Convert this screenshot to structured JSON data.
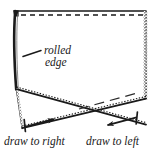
{
  "figure": {
    "kind": "sewing-instruction-diagram",
    "background_color": "#ffffff",
    "ink_color": "#1a1a1a"
  },
  "labels": {
    "rolled_edge": {
      "line1": "rolled",
      "line2": "edge"
    },
    "draw_left_caption": "draw to right",
    "draw_right_caption": "draw to left"
  },
  "geometry": {
    "panel_top_y": 11,
    "panel_left_x": 14,
    "panel_right_x": 146,
    "panel_bottom_left_y": 128,
    "panel_bottom_right_y": 125,
    "cross_point": {
      "x": 78,
      "y": 110
    }
  },
  "strokes": {
    "top_solid": {
      "from": [
        15,
        11
      ],
      "to": [
        146,
        11
      ]
    },
    "top_dashed": {
      "from": [
        20,
        15
      ],
      "to": [
        143,
        15
      ],
      "dash": "5,4"
    },
    "left_edge_rolled": {
      "from": [
        15,
        11
      ],
      "to": [
        16,
        89
      ]
    },
    "right_edge_stippled": {
      "from": [
        146,
        11
      ],
      "to": [
        146,
        99
      ]
    },
    "diagonal_down_right": {
      "from": [
        16,
        89
      ],
      "to": [
        146,
        125
      ]
    },
    "diagonal_down_left": {
      "from": [
        146,
        99
      ],
      "to": [
        22,
        128
      ]
    },
    "bottom_left_stub": {
      "from": [
        16,
        89
      ],
      "to": [
        22,
        128
      ]
    },
    "hint_dashed_diagonal": {
      "from": [
        78,
        110
      ],
      "to": [
        139,
        93
      ],
      "dash": "9,5"
    },
    "leader_rolled_edge": {
      "from": [
        38,
        50
      ],
      "to": [
        22,
        57
      ]
    }
  },
  "arrows": [
    {
      "name": "draw-to-right-arrow",
      "direction": "right",
      "tail": [
        24,
        126
      ],
      "head": [
        57,
        118
      ],
      "tick": {
        "from": [
          24,
          119
        ],
        "to": [
          25,
          131
        ]
      }
    },
    {
      "name": "draw-to-left-arrow",
      "direction": "left",
      "tail": [
        137,
        117
      ],
      "head": [
        104,
        126
      ],
      "tick": {
        "from": [
          137,
          112
        ],
        "to": [
          136,
          124
        ]
      }
    }
  ]
}
